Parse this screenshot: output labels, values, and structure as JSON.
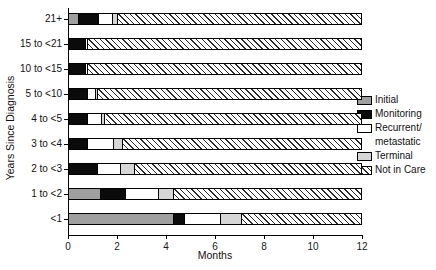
{
  "chart_data": {
    "type": "bar",
    "orientation": "horizontal",
    "stacked": true,
    "title": "",
    "xlabel": "Months",
    "ylabel": "Years Since Diagnosis",
    "xlim": [
      0,
      12
    ],
    "x_ticks": [
      0,
      2,
      4,
      6,
      8,
      10,
      12
    ],
    "grid": false,
    "categories": [
      "21+",
      "15 to <21",
      "10 to <15",
      "5 to <10",
      "4 to <5",
      "3 to <4",
      "2 to <3",
      "1 to <2",
      "<1"
    ],
    "series": [
      {
        "id": "initial",
        "name": "Initial",
        "pattern": "solid",
        "color": "#9f9f9f",
        "values": [
          0.4,
          0,
          0,
          0,
          0,
          0,
          0,
          1.3,
          4.3
        ]
      },
      {
        "id": "monitoring",
        "name": "Monitoring",
        "pattern": "solid",
        "color": "#0b0b0b",
        "values": [
          0.85,
          0.7,
          0.7,
          0.8,
          0.8,
          0.8,
          1.2,
          1.05,
          0.45
        ]
      },
      {
        "id": "recurrent",
        "name": "Recurrent/metastatic",
        "pattern": "solid",
        "color": "#ffffff",
        "values": [
          0.55,
          0.1,
          0.1,
          0.3,
          0.55,
          1.05,
          0.95,
          1.35,
          1.5
        ]
      },
      {
        "id": "terminal",
        "name": "Terminal",
        "pattern": "solid",
        "color": "#d6d6d6",
        "values": [
          0.2,
          0,
          0,
          0.1,
          0.15,
          0.35,
          0.55,
          0.6,
          0.85
        ]
      },
      {
        "id": "not-in-care",
        "name": "Not in Care",
        "pattern": "hatch",
        "color": "#ffffff",
        "values": [
          10.0,
          11.2,
          11.2,
          10.8,
          10.5,
          9.8,
          9.3,
          7.7,
          4.9
        ]
      }
    ]
  },
  "legend": {
    "position": "right",
    "entries": [
      {
        "series": "initial",
        "label_lines": [
          "Initial"
        ]
      },
      {
        "series": "monitoring",
        "label_lines": [
          "Monitoring"
        ]
      },
      {
        "series": "recurrent",
        "label_lines": [
          "Recurrent/",
          "metastatic"
        ]
      },
      {
        "series": "terminal",
        "label_lines": [
          "Terminal"
        ]
      },
      {
        "series": "not-in-care",
        "label_lines": [
          "Not in Care"
        ]
      }
    ]
  },
  "style": {
    "background": "#ffffff",
    "axis_color": "#000000",
    "bar_border": "#000000",
    "hatch_bg": "#ffffff",
    "hatch_line": "#2b2b2b"
  }
}
